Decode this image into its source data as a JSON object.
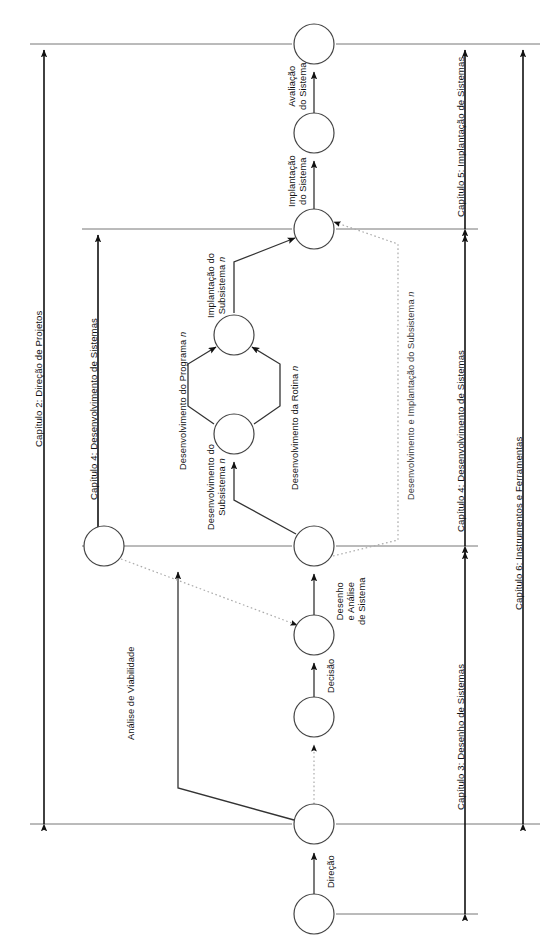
{
  "diagram": {
    "language": "pt-BR",
    "background": "#ffffff",
    "line_color": "#555555",
    "arrow_color": "#111111",
    "dotted_color": "#9a9a9a"
  },
  "chapter_scales": [
    {
      "id": "cap2",
      "label": "Capítulo 2: Direção de Projetos"
    },
    {
      "id": "cap4left",
      "label": "Capítulo 4: Desenvolvimento de Sistemas"
    },
    {
      "id": "cap5",
      "label": "Capítulo 5: Implantação de Sistemas"
    },
    {
      "id": "cap4right",
      "label": "Capítulo 4: Desenvolvimento de Sistemas"
    },
    {
      "id": "cap3",
      "label": "Capítulo 3: Desenho de Sistemas"
    },
    {
      "id": "cap6",
      "label": "Capítulo 6: Instrumentos e Ferramentas"
    }
  ],
  "edge_labels": [
    {
      "id": "avaliacao",
      "line1": "Avaliação",
      "line2": "do Sistema"
    },
    {
      "id": "implantacao-sistema",
      "line1": "Implantação",
      "line2": "do Sistema"
    },
    {
      "id": "implantacao-subsistema",
      "line1": "Implantação do",
      "line2": "Subsistema",
      "italic": "n"
    },
    {
      "id": "desenv-programa",
      "line1": "Desenvolvimento do Programa",
      "italic": "n"
    },
    {
      "id": "desenv-rotina",
      "line1": "Desenvolvimento da Rotina",
      "italic": "n"
    },
    {
      "id": "desenv-subsistema",
      "line1": "Desenvolvimento do",
      "line2": "Subsistema",
      "italic": "n"
    },
    {
      "id": "desenv-impl-subsistema",
      "line1": "Desenvolvimento e Implantação do Subsistema",
      "italic": "n"
    },
    {
      "id": "desenho-analise",
      "line1": "Desenho",
      "line2": "e Análise",
      "line3": "de Sistema"
    },
    {
      "id": "decisao",
      "line1": "Decisão"
    },
    {
      "id": "analise-viabilidade",
      "line1": "Análise de Viabilidade"
    },
    {
      "id": "direcao",
      "line1": "Direção"
    }
  ],
  "nodes": [
    {
      "id": "n-avaliacao-fim",
      "cx": 314,
      "cy": 44,
      "r": 20
    },
    {
      "id": "n-sistema-implantado",
      "cx": 314,
      "cy": 133,
      "r": 20
    },
    {
      "id": "n-subsistema-hub",
      "cx": 314,
      "cy": 229,
      "r": 20
    },
    {
      "id": "n-programa-rotina-join",
      "cx": 234,
      "cy": 335,
      "r": 20
    },
    {
      "id": "n-subsistema-split",
      "cx": 234,
      "cy": 434,
      "r": 20
    },
    {
      "id": "n-sistema-desenhado",
      "cx": 314,
      "cy": 546,
      "r": 20
    },
    {
      "id": "n-decisao",
      "cx": 314,
      "cy": 635,
      "r": 20
    },
    {
      "id": "n-viabilidade-fim",
      "cx": 314,
      "cy": 717,
      "r": 20
    },
    {
      "id": "n-viabilidade-inicio",
      "cx": 104,
      "cy": 546,
      "r": 20
    },
    {
      "id": "n-direcao-fim",
      "cx": 314,
      "cy": 824,
      "r": 20
    },
    {
      "id": "n-direcao-inicio",
      "cx": 314,
      "cy": 914,
      "r": 20
    }
  ]
}
